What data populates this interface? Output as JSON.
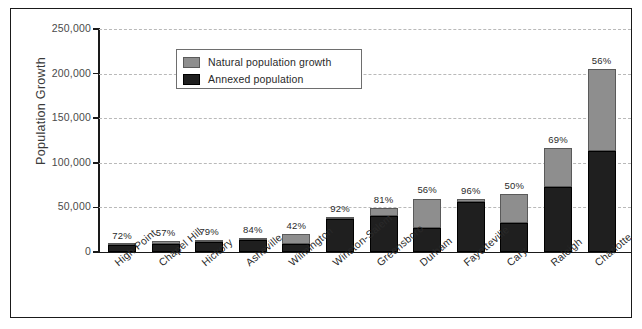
{
  "chart_data": {
    "type": "bar",
    "subtype": "stacked-bar",
    "title": "",
    "xlabel": "",
    "ylabel": "Population Growth",
    "ylim": [
      0,
      250000
    ],
    "ytick_labels": [
      "250,000",
      "200,000",
      "150,000",
      "100,000",
      "50,000",
      "0"
    ],
    "ytick_values": [
      250000,
      200000,
      150000,
      100000,
      50000,
      0
    ],
    "grid": true,
    "grid_style": "dashed-horizontal",
    "legend_position": "upper-left-inside",
    "legend": [
      "Natural population growth",
      "Annexed population"
    ],
    "categories": [
      "High Point",
      "Chapel Hill",
      "Hickory",
      "Asheville",
      "Wilmington",
      "Winston-Salem",
      "Greensboro",
      "Durham",
      "Fayetteville",
      "Cary",
      "Raleigh",
      "Charlotte"
    ],
    "series": [
      {
        "name": "Annexed population",
        "color": "#1f1f1f",
        "values": [
          7500,
          9000,
          11500,
          13500,
          8500,
          37000,
          40000,
          27000,
          56000,
          32000,
          73000,
          113000
        ]
      },
      {
        "name": "Natural population growth",
        "color": "#8e8e8e",
        "values": [
          2000,
          3500,
          2000,
          2000,
          11500,
          2000,
          9000,
          33000,
          3000,
          33000,
          44000,
          92000
        ]
      }
    ],
    "totals": [
      9500,
      12500,
      13500,
      15500,
      20000,
      39000,
      49000,
      60000,
      59000,
      65000,
      117000,
      205000
    ],
    "annotations": {
      "label": "percent annexed",
      "values": [
        "72%",
        "57%",
        "79%",
        "84%",
        "42%",
        "92%",
        "81%",
        "56%",
        "96%",
        "50%",
        "69%",
        "56%"
      ]
    }
  }
}
